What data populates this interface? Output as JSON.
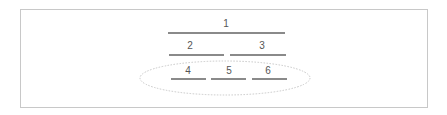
{
  "diagram": {
    "type": "hierarchical-slot-layout",
    "rows": [
      {
        "row": 1,
        "slots": [
          {
            "label": "1",
            "x1": 168,
            "x2": 285,
            "y": 33
          }
        ]
      },
      {
        "row": 2,
        "slots": [
          {
            "label": "2",
            "x1": 169,
            "x2": 224,
            "y": 55
          },
          {
            "label": "3",
            "x1": 230,
            "x2": 286,
            "y": 55
          }
        ]
      },
      {
        "row": 3,
        "grouped": true,
        "slots": [
          {
            "label": "4",
            "x1": 171,
            "x2": 206,
            "y": 79
          },
          {
            "label": "5",
            "x1": 211,
            "x2": 246,
            "y": 79
          },
          {
            "label": "6",
            "x1": 252,
            "x2": 287,
            "y": 79
          }
        ]
      }
    ],
    "group_ellipse": {
      "cx": 225,
      "cy": 78,
      "rx": 85,
      "ry": 17,
      "stroke": "#c8c8c8",
      "style": "dotted"
    },
    "colors": {
      "frame_border": "#c8c8c8",
      "slot_line": "#8a8a8a",
      "label_text": "#555555",
      "background": "#ffffff"
    }
  }
}
